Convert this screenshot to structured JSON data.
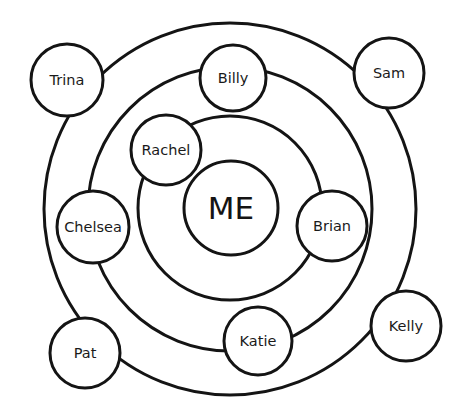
{
  "diagram": {
    "type": "concentric-relationship-circles",
    "stroke_color": "#141414",
    "background": "#ffffff",
    "center": {
      "label": "ME",
      "cx": 231,
      "cy": 208,
      "r": 47
    },
    "rings": [
      {
        "name": "inner-ring",
        "cx": 230,
        "cy": 208,
        "r": 92
      },
      {
        "name": "middle-ring",
        "cx": 230,
        "cy": 209,
        "r": 142
      },
      {
        "name": "outer-ring",
        "cx": 230,
        "cy": 209,
        "r": 186
      }
    ],
    "nodes": [
      {
        "label": "Rachel",
        "ring": "inner-ring",
        "cx": 166,
        "cy": 150,
        "r": 35
      },
      {
        "label": "Brian",
        "ring": "inner-ring",
        "cx": 332,
        "cy": 226,
        "r": 35
      },
      {
        "label": "Billy",
        "ring": "middle-ring",
        "cx": 233,
        "cy": 78,
        "r": 33
      },
      {
        "label": "Chelsea",
        "ring": "middle-ring",
        "cx": 93,
        "cy": 227,
        "r": 36
      },
      {
        "label": "Katie",
        "ring": "middle-ring",
        "cx": 258,
        "cy": 341,
        "r": 34
      },
      {
        "label": "Trina",
        "ring": "outer-ring",
        "cx": 67,
        "cy": 80,
        "r": 36
      },
      {
        "label": "Sam",
        "ring": "outer-ring",
        "cx": 389,
        "cy": 73,
        "r": 35
      },
      {
        "label": "Pat",
        "ring": "outer-ring",
        "cx": 85,
        "cy": 353,
        "r": 35
      },
      {
        "label": "Kelly",
        "ring": "outer-ring",
        "cx": 406,
        "cy": 326,
        "r": 35
      }
    ]
  }
}
